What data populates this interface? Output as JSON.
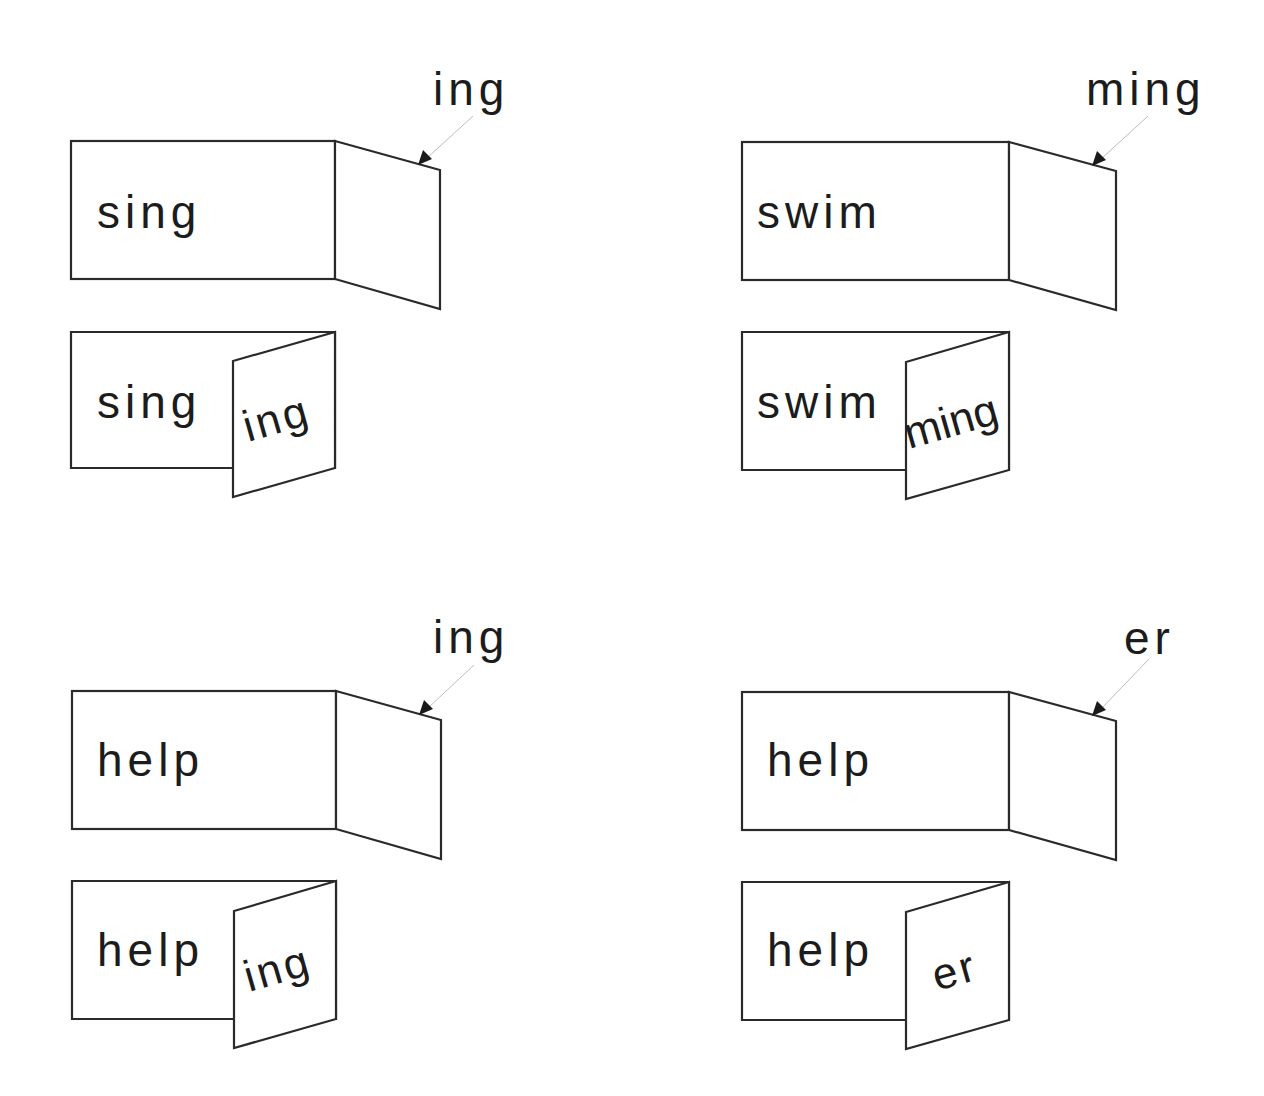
{
  "diagram": {
    "colors": {
      "stroke": "#2a2a2a",
      "text": "#1c1c1c",
      "arrow_line": "#bdbdbd",
      "background": "#ffffff"
    },
    "panels": [
      {
        "id": "sing-ing",
        "base_word": "sing",
        "suffix_label": "ing",
        "flap_text": "ing",
        "result_word": "singing"
      },
      {
        "id": "swim-ming",
        "base_word": "swim",
        "suffix_label": "ming",
        "flap_text": "ming",
        "result_word": "swimming"
      },
      {
        "id": "help-ing",
        "base_word": "help",
        "suffix_label": "ing",
        "flap_text": "ing",
        "result_word": "helping"
      },
      {
        "id": "help-er",
        "base_word": "help",
        "suffix_label": "er",
        "flap_text": "er",
        "result_word": "helper"
      }
    ]
  }
}
